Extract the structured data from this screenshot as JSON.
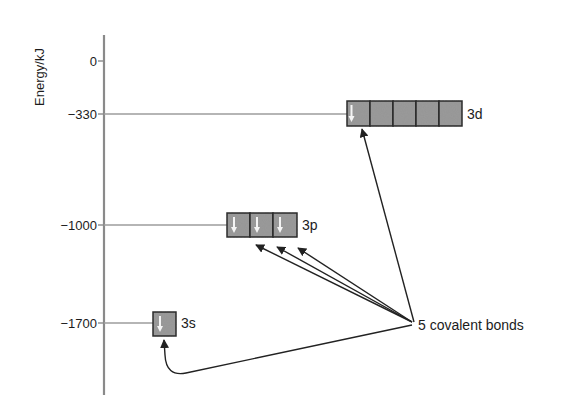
{
  "diagram": {
    "y_axis": {
      "label": "Energy/kJ",
      "ticks": [
        {
          "label": "0",
          "value": 0
        },
        {
          "label": "−330",
          "value": -330
        },
        {
          "label": "−1000",
          "value": -1000
        },
        {
          "label": "−1700",
          "value": -1700
        }
      ]
    },
    "orbitals": [
      {
        "name": "3s",
        "label": "3s",
        "energy": -1700,
        "boxes": 1,
        "electrons": [
          "down"
        ]
      },
      {
        "name": "3p",
        "label": "3p",
        "energy": -1000,
        "boxes": 3,
        "electrons": [
          "down",
          "down",
          "down"
        ]
      },
      {
        "name": "3d",
        "label": "3d",
        "energy": -330,
        "boxes": 5,
        "electrons": [
          "down",
          null,
          null,
          null,
          null
        ]
      }
    ],
    "annotation": {
      "label": "5 covalent bonds",
      "arrows_to": [
        "3s",
        "3p",
        "3p",
        "3p",
        "3d"
      ]
    },
    "colors": {
      "box_fill": "#9a9a9a",
      "box_stroke": "#2a2a2a",
      "axis": "#8a8a8a",
      "level_line": "#9c9c9c",
      "arrow": "#222222",
      "electron": "#f4f4f4"
    }
  }
}
